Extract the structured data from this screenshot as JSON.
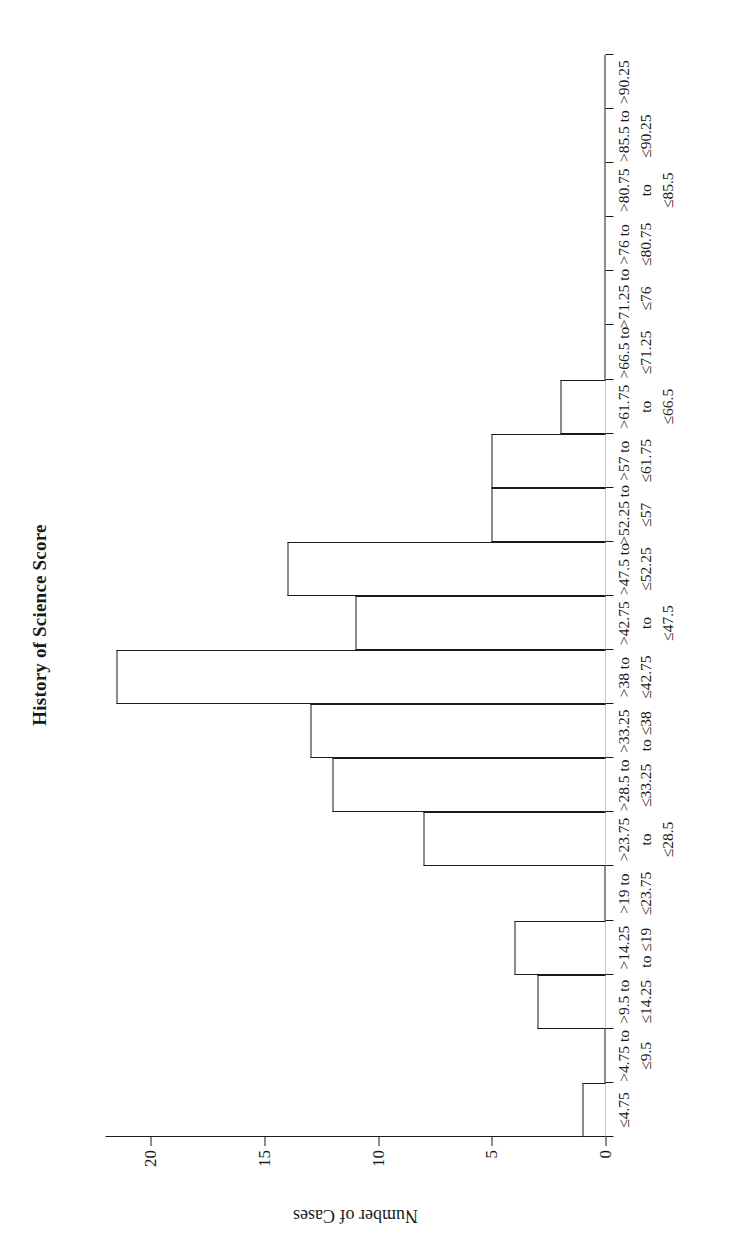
{
  "chart_data": {
    "type": "bar",
    "title": "History of Science Score",
    "xlabel": "",
    "ylabel": "Number of Cases",
    "categories": [
      "≤4.75",
      ">4.75 to\n≤9.5",
      ">9.5 to\n≤14.25",
      ">14.25\nto ≤19",
      ">19 to\n≤23.75",
      ">23.75\nto\n≤28.5",
      ">28.5 to\n≤33.25",
      ">33.25\nto ≤38",
      ">38 to\n≤42.75",
      ">42.75\nto\n≤47.5",
      ">47.5 to\n≤52.25",
      ">52.25 to\n≤57",
      ">57 to\n≤61.75",
      ">61.75\nto\n≤66.5",
      ">66.5 to\n≤71.25",
      ">71.25 to\n≤76",
      ">76 to\n≤80.75",
      ">80.75\nto\n≤85.5",
      ">85.5 to\n≤90.25",
      ">90.25"
    ],
    "values": [
      1,
      0,
      3,
      4,
      0,
      8,
      12,
      13,
      21.5,
      11,
      14,
      5,
      5,
      2,
      0,
      0,
      0,
      0,
      0,
      0
    ],
    "yticks": [
      0,
      5,
      10,
      15,
      20
    ],
    "ylim": [
      0,
      22
    ],
    "grid": false,
    "legend": false,
    "bar_fill": "#ffffff",
    "bar_stroke": "#1a1a1a"
  }
}
